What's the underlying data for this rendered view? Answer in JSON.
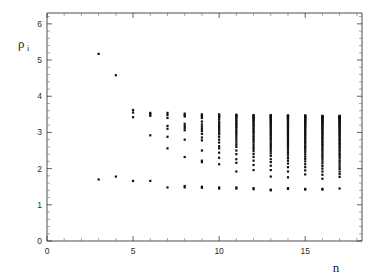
{
  "figure": {
    "background_color": "#ffffff",
    "frame_color": "#3a3a3a",
    "point_color": "#111111"
  },
  "axes": {
    "x_title": "n",
    "y_title": "ρ",
    "y_title_subscript": "i",
    "x_tick_labels": [
      "0",
      "5",
      "10",
      "15"
    ],
    "y_tick_labels": [
      "0",
      "1",
      "2",
      "3",
      "4",
      "5",
      "6"
    ]
  },
  "chart_data": {
    "type": "scatter",
    "title": "",
    "subtitle": "",
    "xlabel": "n",
    "ylabel": "ρ_i",
    "xlim": [
      0,
      18.3
    ],
    "ylim": [
      0,
      6.3
    ],
    "xticks": [
      0,
      5,
      10,
      15
    ],
    "yticks": [
      0,
      1,
      2,
      3,
      4,
      5,
      6
    ],
    "x_minor_tick_step": 1,
    "y_minor_tick_step": 0.2,
    "grid": false,
    "legend": null,
    "legend_position": "none",
    "marker": "square",
    "marker_size_px": 2.2,
    "annotations": [],
    "series": [
      {
        "name": "rho_i",
        "points_by_n": [
          {
            "n": 3,
            "values": [
              5.17,
              1.7
            ]
          },
          {
            "n": 4,
            "values": [
              4.58,
              1.78
            ]
          },
          {
            "n": 5,
            "values": [
              3.62,
              3.55,
              3.42,
              1.66
            ]
          },
          {
            "n": 6,
            "values": [
              3.54,
              3.5,
              3.46,
              2.92,
              1.66
            ]
          },
          {
            "n": 7,
            "values": [
              3.54,
              3.48,
              3.4,
              3.18,
              3.1,
              2.88,
              2.56,
              1.48
            ]
          },
          {
            "n": 8,
            "values": [
              3.52,
              3.48,
              3.44,
              3.24,
              3.18,
              3.12,
              3.06,
              2.8,
              2.32,
              1.52,
              1.48
            ]
          },
          {
            "n": 9,
            "values": [
              3.5,
              3.47,
              3.44,
              3.4,
              3.3,
              3.22,
              3.16,
              3.1,
              3.04,
              2.96,
              2.86,
              2.78,
              2.5,
              2.22,
              2.18,
              1.5,
              1.47
            ]
          },
          {
            "n": 10,
            "values": [
              3.5,
              3.47,
              3.44,
              3.41,
              3.36,
              3.3,
              3.25,
              3.2,
              3.15,
              3.1,
              3.05,
              3.0,
              2.95,
              2.88,
              2.8,
              2.72,
              2.62,
              2.56,
              2.44,
              2.3,
              2.12,
              1.48,
              1.45
            ]
          },
          {
            "n": 11,
            "values": [
              3.49,
              3.47,
              3.45,
              3.42,
              3.39,
              3.35,
              3.31,
              3.27,
              3.23,
              3.19,
              3.15,
              3.11,
              3.06,
              3.01,
              2.96,
              2.9,
              2.84,
              2.78,
              2.72,
              2.66,
              2.6,
              2.5,
              2.4,
              2.26,
              2.16,
              1.92,
              1.48,
              1.45
            ]
          },
          {
            "n": 12,
            "values": [
              3.48,
              3.46,
              3.44,
              3.42,
              3.4,
              3.37,
              3.34,
              3.31,
              3.28,
              3.24,
              3.21,
              3.17,
              3.13,
              3.09,
              3.05,
              3.01,
              2.97,
              2.92,
              2.87,
              2.82,
              2.77,
              2.72,
              2.66,
              2.6,
              2.54,
              2.48,
              2.4,
              2.32,
              2.22,
              2.1,
              1.96,
              1.46,
              1.43
            ]
          },
          {
            "n": 13,
            "values": [
              3.48,
              3.46,
              3.45,
              3.43,
              3.41,
              3.39,
              3.36,
              3.34,
              3.31,
              3.28,
              3.25,
              3.22,
              3.19,
              3.15,
              3.12,
              3.08,
              3.05,
              3.01,
              2.97,
              2.93,
              2.89,
              2.84,
              2.8,
              2.75,
              2.7,
              2.65,
              2.6,
              2.54,
              2.48,
              2.42,
              2.35,
              2.26,
              2.18,
              2.08,
              1.96,
              1.78,
              1.42,
              1.4
            ]
          },
          {
            "n": 14,
            "values": [
              3.47,
              3.46,
              3.45,
              3.43,
              3.42,
              3.4,
              3.38,
              3.36,
              3.33,
              3.31,
              3.28,
              3.26,
              3.23,
              3.2,
              3.17,
              3.14,
              3.11,
              3.07,
              3.04,
              3.0,
              2.97,
              2.93,
              2.89,
              2.85,
              2.81,
              2.77,
              2.72,
              2.68,
              2.63,
              2.58,
              2.53,
              2.47,
              2.42,
              2.36,
              2.29,
              2.22,
              2.14,
              2.04,
              1.92,
              1.76,
              1.46,
              1.44
            ]
          },
          {
            "n": 15,
            "values": [
              3.47,
              3.46,
              3.45,
              3.44,
              3.42,
              3.41,
              3.39,
              3.37,
              3.35,
              3.33,
              3.31,
              3.29,
              3.26,
              3.24,
              3.21,
              3.18,
              3.16,
              3.13,
              3.1,
              3.06,
              3.03,
              3.0,
              2.96,
              2.93,
              2.89,
              2.85,
              2.81,
              2.77,
              2.73,
              2.69,
              2.64,
              2.6,
              2.55,
              2.5,
              2.45,
              2.39,
              2.33,
              2.27,
              2.2,
              2.12,
              2.04,
              1.95,
              1.84,
              1.44,
              1.42
            ]
          },
          {
            "n": 16,
            "values": [
              3.46,
              3.45,
              3.44,
              3.43,
              3.42,
              3.41,
              3.4,
              3.38,
              3.36,
              3.34,
              3.32,
              3.3,
              3.28,
              3.26,
              3.24,
              3.21,
              3.19,
              3.16,
              3.13,
              3.11,
              3.08,
              3.05,
              3.02,
              2.98,
              2.95,
              2.92,
              2.88,
              2.85,
              2.81,
              2.77,
              2.73,
              2.69,
              2.65,
              2.61,
              2.56,
              2.52,
              2.47,
              2.42,
              2.37,
              2.32,
              2.26,
              2.2,
              2.14,
              2.07,
              2.0,
              1.92,
              1.83,
              1.72,
              1.44,
              1.42
            ]
          },
          {
            "n": 17,
            "values": [
              3.46,
              3.45,
              3.44,
              3.43,
              3.42,
              3.41,
              3.4,
              3.39,
              3.37,
              3.36,
              3.34,
              3.32,
              3.3,
              3.28,
              3.26,
              3.24,
              3.22,
              3.2,
              3.17,
              3.15,
              3.12,
              3.1,
              3.07,
              3.04,
              3.01,
              2.98,
              2.95,
              2.92,
              2.89,
              2.86,
              2.82,
              2.79,
              2.75,
              2.71,
              2.68,
              2.64,
              2.6,
              2.56,
              2.51,
              2.47,
              2.42,
              2.38,
              2.33,
              2.28,
              2.22,
              2.17,
              2.11,
              2.05,
              1.99,
              1.92,
              1.85,
              1.77,
              1.45
            ]
          }
        ]
      }
    ]
  }
}
